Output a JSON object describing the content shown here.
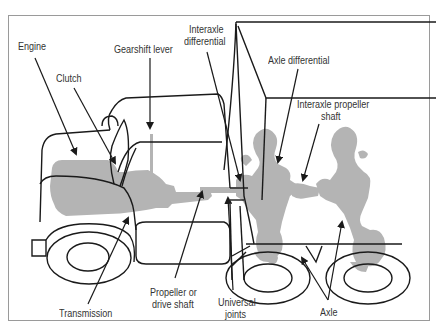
{
  "diagram": {
    "colors": {
      "component_fill": "#b4b4b4",
      "line": "#1a1a1a",
      "label_text": "#333333",
      "frame": "#9a9a9a"
    },
    "labels": {
      "engine": "Engine",
      "clutch": "Clutch",
      "gearshift_lever": "Gearshift lever",
      "interaxle_differential_1": "Interaxle",
      "interaxle_differential_2": "differential",
      "axle_differential": "Axle differential",
      "interaxle_propeller_shaft_1": "Interaxle propeller",
      "interaxle_propeller_shaft_2": "shaft",
      "transmission": "Transmission",
      "propeller_shaft_1": "Propeller or",
      "propeller_shaft_2": "drive shaft",
      "universal_joints_1": "Universal",
      "universal_joints_2": "joints",
      "axle": "Axle"
    }
  }
}
